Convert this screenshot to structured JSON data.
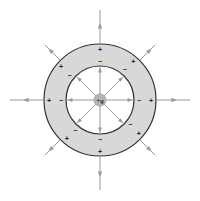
{
  "diagram": {
    "center": {
      "x": 100,
      "y": 100
    },
    "charge_label": "+q",
    "shell": {
      "outer_radius": 56,
      "inner_radius": 34,
      "fill_color": "#d8d8d8",
      "stroke_color": "#333333"
    },
    "field_line_color": "#9a9a9a",
    "charge_color": "#b5b5b5",
    "inner_surface_sign": "−",
    "outer_surface_sign": "+",
    "directions_deg": [
      0,
      45,
      90,
      135,
      180,
      225,
      270,
      315
    ],
    "inner_surface_charge_count": 8,
    "outer_surface_charge_count": 8
  }
}
